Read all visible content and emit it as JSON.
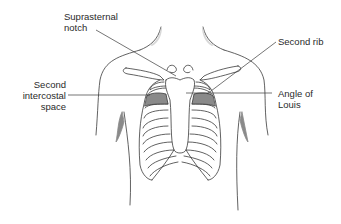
{
  "diagram": {
    "colors": {
      "outline": "#3a3a3a",
      "shaded": "#8a8a8a",
      "shoulder_shade": "#d8d8d8",
      "leader": "#3a3a3a",
      "text": "#2a2a2a"
    },
    "labels": [
      {
        "id": "suprasternal-notch",
        "lines": [
          "Suprasternal",
          "notch"
        ]
      },
      {
        "id": "second-rib",
        "lines": [
          "Second rib"
        ]
      },
      {
        "id": "second-intercostal-space",
        "lines": [
          "Second",
          "intercostal",
          "space"
        ]
      },
      {
        "id": "angle-of-louis",
        "lines": [
          "Angle of",
          "Louis"
        ]
      }
    ]
  }
}
